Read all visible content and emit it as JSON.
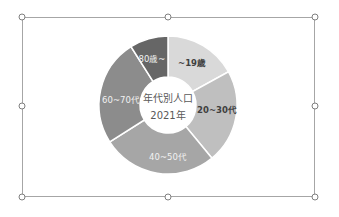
{
  "chart_data": {
    "type": "pie",
    "subtype": "doughnut",
    "title": "年代別人口 2021年",
    "center_text": [
      "年代別人口",
      "2021年"
    ],
    "categories": [
      "~19歳",
      "20~30代",
      "40~50代",
      "60~70代",
      "80歳~"
    ],
    "values": [
      17,
      22,
      27,
      25,
      9
    ],
    "unit": "%",
    "colors": [
      "#d9d9d9",
      "#bfbfbf",
      "#a6a6a6",
      "#8c8c8c",
      "#666666"
    ],
    "start_angle": 0,
    "direction": "clockwise",
    "legend": "none",
    "data_labels": "category name inside segments"
  },
  "labels": {
    "seg0": "~19歳",
    "seg1": "20~30代",
    "seg2": "40~50代",
    "seg3": "60~70代",
    "seg4": "80歳~",
    "center_line1": "年代別人口",
    "center_line2": "2021年"
  }
}
